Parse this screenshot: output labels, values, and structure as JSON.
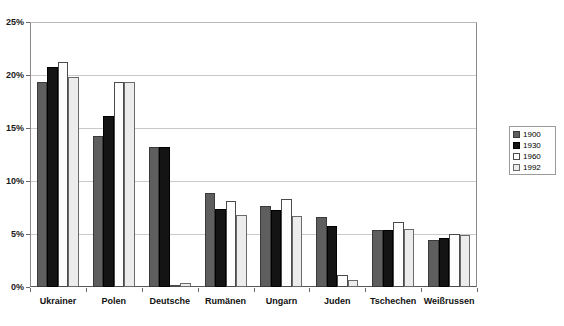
{
  "chart_data": {
    "type": "bar",
    "title": "",
    "xlabel": "",
    "ylabel": "",
    "ylim": [
      0,
      25
    ],
    "ytick_labels": [
      "25%",
      "20%",
      "15%",
      "10%",
      "5%",
      "0%"
    ],
    "yticks": [
      25,
      20,
      15,
      10,
      5,
      0
    ],
    "grid": true,
    "legend_position": "right",
    "categories": [
      "Ukrainer",
      "Polen",
      "Deutsche",
      "Rumänen",
      "Ungarn",
      "Juden",
      "Tschechen",
      "Weißrussen"
    ],
    "series": [
      {
        "name": "1900",
        "color": "#5e5e5e",
        "values": [
          19.3,
          14.2,
          13.2,
          8.9,
          7.6,
          6.6,
          5.4,
          4.4
        ]
      },
      {
        "name": "1930",
        "color": "#141414",
        "values": [
          20.8,
          16.1,
          13.2,
          7.4,
          7.3,
          5.8,
          5.4,
          4.6
        ]
      },
      {
        "name": "1960",
        "color": "#fdfdfd",
        "values": [
          21.2,
          19.3,
          0.05,
          8.1,
          8.3,
          1.1,
          6.1,
          5.0
        ]
      },
      {
        "name": "1992",
        "color": "#ececec",
        "values": [
          19.8,
          19.3,
          0.4,
          6.8,
          6.7,
          0.7,
          5.5,
          4.9
        ]
      }
    ]
  },
  "legend": {
    "entries": [
      {
        "label": "1900"
      },
      {
        "label": "1930"
      },
      {
        "label": "1960"
      },
      {
        "label": "1992"
      }
    ]
  }
}
